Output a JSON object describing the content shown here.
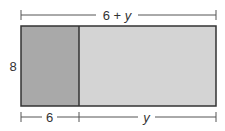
{
  "diagram": {
    "top_label_num": "6 + ",
    "top_label_var": "y",
    "left_label": "8",
    "bottom_left_label": "6",
    "bottom_right_label": "y",
    "colors": {
      "left_fill": "#a9a9a9",
      "right_fill": "#d4d4d4",
      "stroke": "#333333",
      "dim_line": "#555555"
    }
  }
}
